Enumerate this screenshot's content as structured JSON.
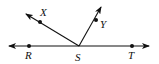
{
  "diagram": {
    "type": "geometry-rays",
    "vertex": {
      "label": "S",
      "x": 79,
      "y": 46
    },
    "line": {
      "from": {
        "x": 9,
        "y": 46
      },
      "to": {
        "x": 149,
        "y": 46
      }
    },
    "points": [
      {
        "label": "R",
        "x": 29,
        "y": 46,
        "label_x": 25,
        "label_y": 59
      },
      {
        "label": "T",
        "x": 132,
        "y": 46,
        "label_x": 128,
        "label_y": 59
      },
      {
        "label": "X",
        "x": 40,
        "y": 22,
        "label_x": 40,
        "label_y": 16
      },
      {
        "label": "Y",
        "x": 96,
        "y": 20,
        "label_x": 100,
        "label_y": 28
      }
    ],
    "rays": [
      {
        "name": "ray-SX",
        "from": {
          "x": 79,
          "y": 46
        },
        "to": {
          "x": 26,
          "y": 14
        }
      },
      {
        "name": "ray-SY",
        "from": {
          "x": 79,
          "y": 46
        },
        "to": {
          "x": 101,
          "y": 7
        }
      }
    ],
    "vertex_label": {
      "text": "S",
      "x": 75,
      "y": 61
    },
    "stroke_color": "#111111"
  }
}
